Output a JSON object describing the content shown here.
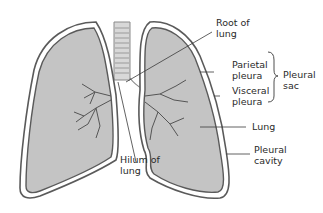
{
  "diagram": {
    "labels": {
      "root_of_lung": "Root of\nlung",
      "parietal_pleura": "Parietal\npleura",
      "visceral_pleura": "Visceral\npleura",
      "pleural_sac": "Pleural\nsac",
      "lung": "Lung",
      "pleural_cavity": "Pleural\ncavity",
      "hilum_of_lung": "Hilum of\nlung"
    },
    "colors": {
      "lung_fill": "#c4c4c4",
      "outline": "#5a5a5a",
      "pleural_gap": "#ffffff",
      "trachea_fill": "#d8d8d8",
      "text": "#2a2a2a"
    }
  }
}
